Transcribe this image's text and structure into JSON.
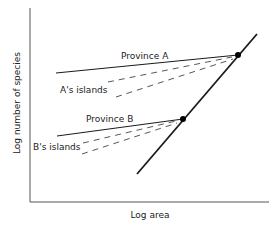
{
  "diagram": {
    "x_axis_label": "Log area",
    "y_axis_label": "Log number of species",
    "labels": {
      "province_a": "Province A",
      "a_islands": "A's islands",
      "province_b": "Province B",
      "b_islands": "B's islands"
    },
    "colors": {
      "line": "#1a1a1a",
      "axis": "#555555",
      "dashed": "#444444"
    }
  }
}
